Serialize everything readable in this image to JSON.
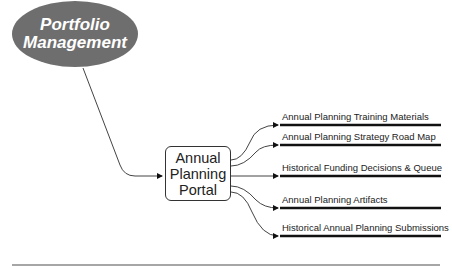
{
  "source_node": {
    "line1": "Portfolio",
    "line2": "Management",
    "fill": "#6e6e6e"
  },
  "hub_node": {
    "line1": "Annual",
    "line2": "Planning",
    "line3": "Portal"
  },
  "branches": [
    {
      "label": "Annual Planning Training Materials",
      "y": 139
    },
    {
      "label": "Annual Planning Strategy Road Map",
      "y": 173
    },
    {
      "label": "Historical Funding Decisions & Queue",
      "y": 178
    },
    {
      "label": "Annual Planning Artifacts",
      "y": 211
    },
    {
      "label": "Historical Annual Planning Submissions",
      "y": 245
    }
  ]
}
